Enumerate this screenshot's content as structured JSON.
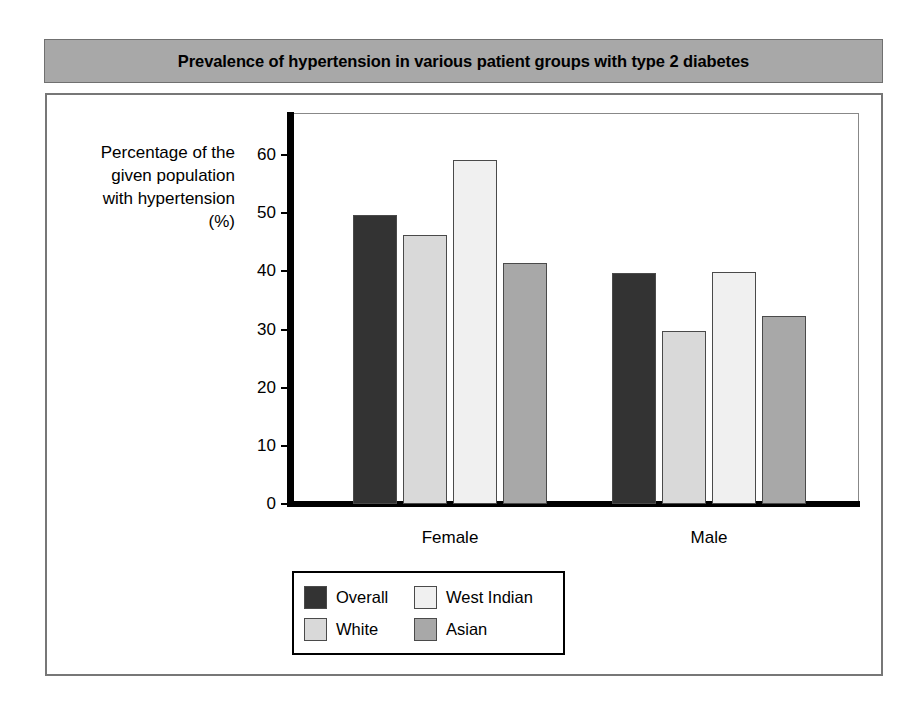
{
  "title": "Prevalence of hypertension in various patient groups with type 2 diabetes",
  "axis": {
    "y_title_lines": [
      "Percentage of the",
      "given population",
      "with hypertension",
      "(%)"
    ],
    "y_title": "Percentage of the given population with hypertension (%)",
    "y_ticks": [
      "60",
      "50",
      "40",
      "30",
      "20",
      "10",
      "0"
    ]
  },
  "legend": {
    "items": [
      {
        "label": "Overall",
        "color": "#333333"
      },
      {
        "label": "West Indian",
        "color": "#f0f0f0"
      },
      {
        "label": "White",
        "color": "#d9d9d9"
      },
      {
        "label": "Asian",
        "color": "#a8a8a8"
      }
    ]
  },
  "chart_data": {
    "type": "bar",
    "title": "Prevalence of hypertension in various patient groups with type 2 diabetes",
    "xlabel": "",
    "ylabel": "Percentage of the given population with hypertension (%)",
    "ylim": [
      0,
      62
    ],
    "yticks": [
      0,
      10,
      20,
      30,
      40,
      50,
      60
    ],
    "grid": false,
    "legend_position": "bottom-left",
    "categories": [
      "Female",
      "Male"
    ],
    "series": [
      {
        "name": "Overall",
        "color": "#333333",
        "values": [
          49.6,
          39.7
        ]
      },
      {
        "name": "White",
        "color": "#d9d9d9",
        "values": [
          46.3,
          29.7
        ]
      },
      {
        "name": "West Indian",
        "color": "#f0f0f0",
        "values": [
          59.2,
          39.8
        ]
      },
      {
        "name": "Asian",
        "color": "#a8a8a8",
        "values": [
          41.4,
          32.4
        ]
      }
    ]
  }
}
